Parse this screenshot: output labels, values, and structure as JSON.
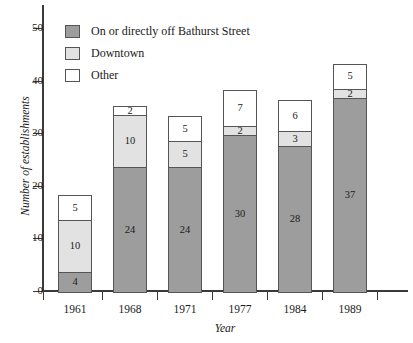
{
  "chart_data": {
    "type": "bar",
    "subtype": "stacked-vertical",
    "title": "",
    "xlabel": "Year",
    "ylabel": "Number of establishments",
    "categories": [
      "1961",
      "1968",
      "1971",
      "1977",
      "1984",
      "1989"
    ],
    "series": [
      {
        "name": "On or directly off Bathurst Street",
        "color": "#9d9d9d",
        "values": [
          4,
          24,
          24,
          30,
          28,
          37
        ]
      },
      {
        "name": "Downtown",
        "color": "#e2e2e2",
        "values": [
          10,
          10,
          5,
          2,
          3,
          2
        ]
      },
      {
        "name": "Other",
        "color": "#ffffff",
        "values": [
          5,
          2,
          5,
          7,
          6,
          5
        ]
      }
    ],
    "totals": [
      19,
      36,
      34,
      39,
      37,
      44
    ],
    "ylim": [
      0,
      52
    ],
    "yticks": [
      0,
      10,
      20,
      30,
      40,
      50
    ],
    "ytick_labels": [
      "0",
      "10",
      "20",
      "30",
      "40",
      "50"
    ],
    "grid": false,
    "legend_position": "top-left",
    "data_labels": true
  },
  "legend": {
    "items": [
      {
        "label": "On or directly off Bathurst Street",
        "swatch": "dark-gray"
      },
      {
        "label": "Downtown",
        "swatch": "light-gray"
      },
      {
        "label": "Other",
        "swatch": "white"
      }
    ]
  },
  "axes": {
    "y_title": "Number of establishments",
    "x_title": "Year",
    "y_tick_labels": [
      "0",
      "10",
      "20",
      "30",
      "40",
      "50"
    ],
    "x_tick_labels": [
      "1961",
      "1968",
      "1971",
      "1977",
      "1984",
      "1989"
    ]
  }
}
